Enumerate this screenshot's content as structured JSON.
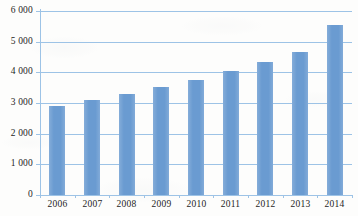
{
  "chart_data": {
    "type": "bar",
    "title": "",
    "subtitle": "",
    "xlabel": "",
    "ylabel": "",
    "categories": [
      "2006",
      "2007",
      "2008",
      "2009",
      "2010",
      "2011",
      "2012",
      "2013",
      "2014"
    ],
    "values": [
      2900,
      3100,
      3290,
      3520,
      3760,
      4060,
      4340,
      4650,
      5540
    ],
    "series": [
      {
        "name": "",
        "values": [
          2900,
          3100,
          3290,
          3520,
          3760,
          4060,
          4340,
          4650,
          5540
        ]
      }
    ],
    "ylim": [
      0,
      6000
    ],
    "ytick_values": [
      0,
      1000,
      2000,
      3000,
      4000,
      5000,
      6000
    ],
    "ytick_labels": [
      "0",
      "1 000",
      "2 000",
      "3 000",
      "4 000",
      "5 000",
      "6 000"
    ],
    "xtick_labels": [
      "2006",
      "2007",
      "2008",
      "2009",
      "2010",
      "2011",
      "2012",
      "2013",
      "2014"
    ],
    "grid": true,
    "grid_axis": "y",
    "legend": false,
    "legend_position": "none",
    "bar_color": "#6A9BD1",
    "gridline_color": "#9DC3E6",
    "axis_color": "#9DC3E6",
    "text_color": "#1D1D1D",
    "background_color": "#FDFDFC",
    "annotations": []
  }
}
